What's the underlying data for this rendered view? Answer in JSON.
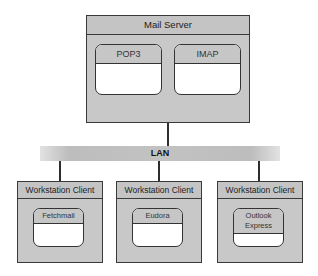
{
  "server": {
    "title": "Mail Server",
    "protocols": [
      {
        "label": "POP3"
      },
      {
        "label": "IMAP"
      }
    ]
  },
  "network": {
    "label": "LAN"
  },
  "clients": [
    {
      "title": "Workstation Client",
      "app": "Fetchmail"
    },
    {
      "title": "Workstation Client",
      "app": "Eudora"
    },
    {
      "title": "Workstation Client",
      "app_line1": "Outlook",
      "app_line2": "Express"
    }
  ],
  "colors": {
    "box_fill": "#c8c8c8",
    "border": "#3a3a3a",
    "inner_fill": "#ffffff"
  }
}
